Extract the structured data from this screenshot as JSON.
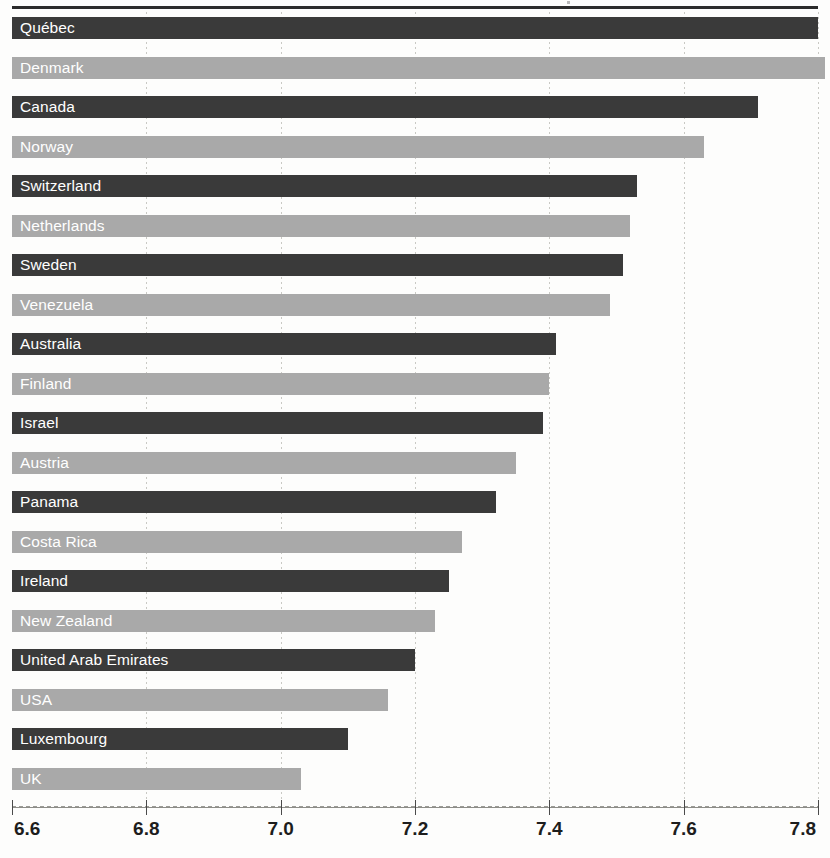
{
  "chart_data": {
    "type": "bar",
    "orientation": "horizontal",
    "title": "",
    "subtitle": "",
    "xlabel": "",
    "ylabel": "",
    "xlim": [
      6.6,
      7.8
    ],
    "xticks": [
      "6.6",
      "6.8",
      "7.0",
      "7.2",
      "7.4",
      "7.6",
      "7.8"
    ],
    "xtick_values": [
      6.6,
      6.8,
      7.0,
      7.2,
      7.4,
      7.6,
      7.8
    ],
    "grid": true,
    "grid_axis": "x",
    "legend": "none",
    "categories": [
      "Québec",
      "Denmark",
      "Canada",
      "Norway",
      "Switzerland",
      "Netherlands",
      "Sweden",
      "Venezuela",
      "Australia",
      "Finland",
      "Israel",
      "Austria",
      "Panama",
      "Costa Rica",
      "Ireland",
      "New Zealand",
      "United Arab Emirates",
      "USA",
      "Luxembourg",
      "UK"
    ],
    "values": [
      7.8,
      7.81,
      7.71,
      7.63,
      7.53,
      7.52,
      7.51,
      7.49,
      7.41,
      7.4,
      7.39,
      7.35,
      7.32,
      7.27,
      7.25,
      7.23,
      7.2,
      7.16,
      7.1,
      7.03
    ],
    "bar_colors": [
      "dark",
      "light",
      "dark",
      "light",
      "dark",
      "light",
      "dark",
      "light",
      "dark",
      "light",
      "dark",
      "light",
      "dark",
      "light",
      "dark",
      "light",
      "dark",
      "light",
      "dark",
      "light"
    ]
  },
  "colors": {
    "bar_dark": "#3a3a3a",
    "bar_light": "#a9a9a9",
    "label_text": "#ffffff",
    "axis_text": "#1d1d1d",
    "grid": "#c9c9c4",
    "top_rule": "#2b2b2b",
    "background": "#fdfdfc"
  }
}
